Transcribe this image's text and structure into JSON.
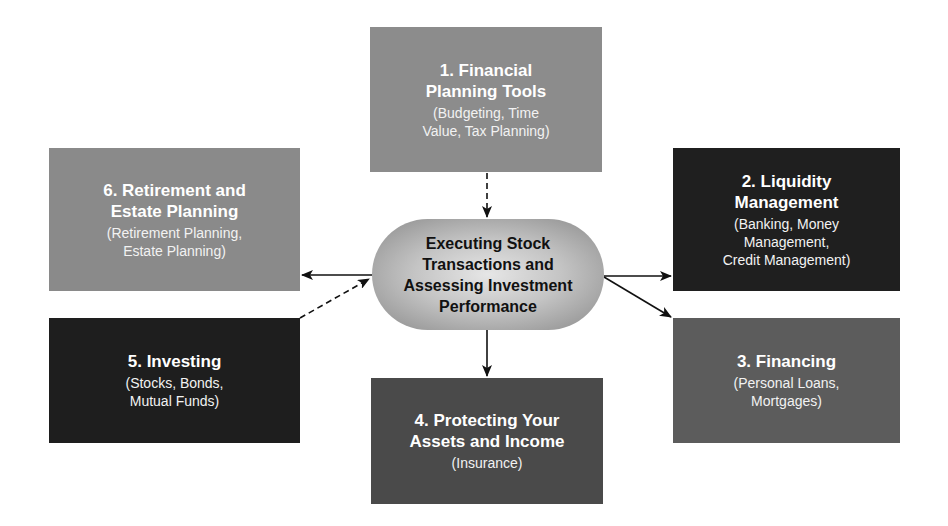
{
  "diagram": {
    "type": "hub-and-spoke",
    "center": {
      "lines": [
        "Executing Stock",
        "Transactions and",
        "Assessing Investment",
        "Performance"
      ]
    },
    "nodes": [
      {
        "id": "1",
        "title_lines": [
          "1. Financial",
          "Planning Tools"
        ],
        "sub_lines": [
          "(Budgeting, Time",
          "Value, Tax Planning)"
        ],
        "color": "#8c8c8c",
        "connection": "dashed arrow into center"
      },
      {
        "id": "2",
        "title_lines": [
          "2. Liquidity",
          "Management"
        ],
        "sub_lines": [
          "(Banking, Money",
          "Management,",
          "Credit Management)"
        ],
        "color": "#1f1f1f",
        "connection": "solid arrow from center"
      },
      {
        "id": "3",
        "title_lines": [
          "3. Financing"
        ],
        "sub_lines": [
          "(Personal Loans,",
          "Mortgages)"
        ],
        "color": "#5c5c5c",
        "connection": "solid arrow from center"
      },
      {
        "id": "4",
        "title_lines": [
          "4. Protecting Your",
          "Assets and Income"
        ],
        "sub_lines": [
          "(Insurance)"
        ],
        "color": "#4a4a4a",
        "connection": "solid arrow from center"
      },
      {
        "id": "5",
        "title_lines": [
          "5. Investing"
        ],
        "sub_lines": [
          "(Stocks, Bonds,",
          "Mutual Funds)"
        ],
        "color": "#1e1e1e",
        "connection": "dashed arrow into center"
      },
      {
        "id": "6",
        "title_lines": [
          "6. Retirement and",
          "Estate Planning"
        ],
        "sub_lines": [
          "(Retirement Planning,",
          "Estate Planning)"
        ],
        "color": "#8a8a8a",
        "connection": "solid arrow from center"
      }
    ]
  }
}
